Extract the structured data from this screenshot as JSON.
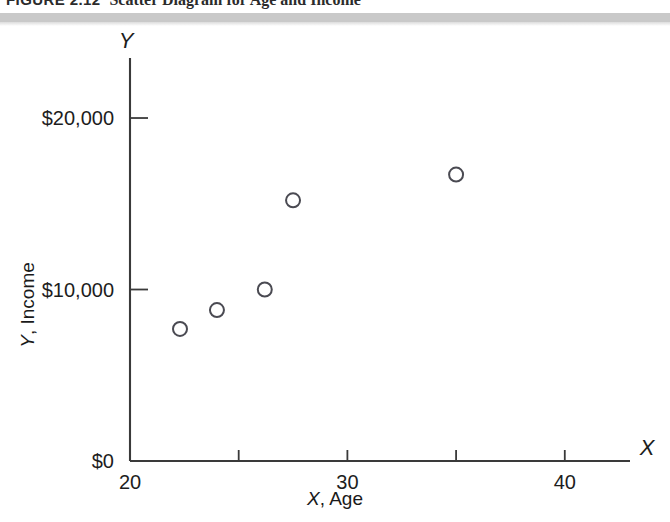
{
  "figure": {
    "label": "FIGURE 2.12",
    "caption": "Scatter Diagram for Age and Income"
  },
  "chart_data": {
    "type": "scatter",
    "title": "Scatter Diagram for Age and Income",
    "xlabel": "X, Age",
    "ylabel": "Y, Income",
    "x_axis_name": "X",
    "y_axis_name": "Y",
    "xlim": [
      20,
      43
    ],
    "ylim": [
      0,
      23500
    ],
    "grid": false,
    "legend": null,
    "x_ticks": [
      {
        "value": 20,
        "label": "20",
        "major": true
      },
      {
        "value": 25,
        "label": "",
        "major": false
      },
      {
        "value": 30,
        "label": "30",
        "major": true
      },
      {
        "value": 35,
        "label": "",
        "major": false
      },
      {
        "value": 40,
        "label": "40",
        "major": true
      }
    ],
    "y_ticks": [
      {
        "value": 0,
        "label": "$0",
        "major": true
      },
      {
        "value": 10000,
        "label": "$10,000",
        "major": true
      },
      {
        "value": 20000,
        "label": "$20,000",
        "major": true
      }
    ],
    "marker": "open-circle",
    "marker_color": "#4a4a52",
    "points": [
      {
        "x": 22.3,
        "y": 7700
      },
      {
        "x": 24.0,
        "y": 8800
      },
      {
        "x": 26.2,
        "y": 10000
      },
      {
        "x": 27.5,
        "y": 15200
      },
      {
        "x": 35.0,
        "y": 16700
      }
    ]
  }
}
